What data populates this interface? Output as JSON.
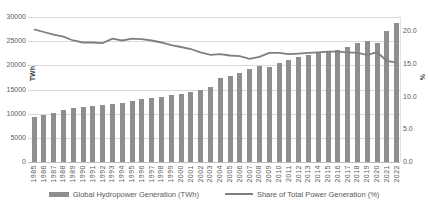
{
  "chart": {
    "left_axis": {
      "title": "TWh",
      "tick_labels": [
        "0",
        "5000",
        "10000",
        "15000",
        "20000",
        "25000",
        "30000"
      ]
    },
    "right_axis": {
      "title": "%",
      "tick_labels": [
        "0.0",
        "5.0",
        "10.0",
        "15.0",
        "20.0"
      ]
    },
    "legend": [
      {
        "label": "Global Hydropower Generation (TWh)",
        "swatch": "bar-swatch-icon"
      },
      {
        "label": "Share of Total Power Generation (%)",
        "swatch": "line-swatch-icon"
      }
    ],
    "colors": {
      "bar": "#8e8e8e",
      "line": "#7f7f7f",
      "grid": "#d9d9d9",
      "axis_text": "#595959"
    }
  },
  "chart_data": {
    "type": "bar",
    "subtype": "bar+line dual axis",
    "title": "",
    "categories": [
      1985,
      1986,
      1987,
      1988,
      1989,
      1990,
      1991,
      1992,
      1993,
      1994,
      1995,
      1996,
      1997,
      1998,
      1999,
      2000,
      2001,
      2002,
      2003,
      2004,
      2005,
      2006,
      2007,
      2008,
      2009,
      2010,
      2011,
      2012,
      2013,
      2014,
      2015,
      2016,
      2017,
      2018,
      2019,
      2020,
      2021,
      2022
    ],
    "series": [
      {
        "name": "Global Hydropower Generation (TWh)",
        "type": "bar",
        "axis": "left",
        "values": [
          9400,
          9750,
          10200,
          10700,
          11200,
          11400,
          11600,
          11750,
          11950,
          12250,
          12600,
          12950,
          13150,
          13450,
          13800,
          14100,
          14450,
          14950,
          15600,
          17350,
          17850,
          18500,
          19200,
          19800,
          19600,
          20500,
          21200,
          21700,
          22200,
          22550,
          22700,
          23100,
          23700,
          24600,
          24950,
          24700,
          27200,
          28700
        ]
      },
      {
        "name": "Share of Total Power Generation (%)",
        "type": "line",
        "axis": "right",
        "values": [
          20.3,
          19.9,
          19.5,
          19.2,
          18.6,
          18.3,
          18.3,
          18.2,
          18.9,
          18.6,
          18.9,
          18.8,
          18.6,
          18.3,
          17.9,
          17.6,
          17.3,
          16.8,
          16.4,
          16.5,
          16.3,
          16.2,
          15.8,
          16.1,
          16.7,
          16.7,
          16.5,
          16.6,
          16.7,
          16.8,
          16.9,
          16.9,
          16.8,
          16.7,
          16.4,
          16.8,
          15.5,
          15.2
        ]
      }
    ],
    "xlabel": "",
    "ylabel_left": "TWh",
    "ylabel_right": "%",
    "left_ylim": [
      0,
      30000
    ],
    "right_ylim": [
      0,
      22.2
    ],
    "left_major_unit": 5000,
    "right_major_unit": 5,
    "grid": true,
    "legend_position": "bottom"
  }
}
